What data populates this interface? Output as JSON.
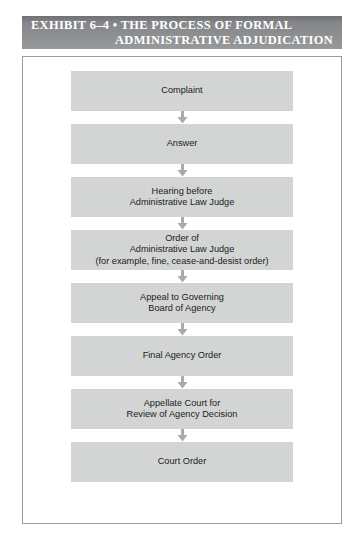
{
  "exhibit": {
    "title_line_1": "EXHIBIT 6–4 • THE PROCESS OF FORMAL",
    "title_line_2": "ADMINISTRATIVE ADJUDICATION",
    "header_bg_color": "#8d8f91",
    "header_text_color": "#ffffff"
  },
  "flowchart": {
    "box_fill_color": "#d3d5d5",
    "box_text_color": "#1b1b1b",
    "arrow_color": "#a9abab",
    "connector_icon": "down-arrow-icon",
    "steps": [
      {
        "lines": [
          "Complaint"
        ]
      },
      {
        "lines": [
          "Answer"
        ]
      },
      {
        "lines": [
          "Hearing before",
          "Administrative Law Judge"
        ]
      },
      {
        "lines": [
          "Order of",
          "Administrative Law Judge",
          "(for example, fine, cease-and-desist order)"
        ]
      },
      {
        "lines": [
          "Appeal to Governing",
          "Board of Agency"
        ]
      },
      {
        "lines": [
          "Final Agency Order"
        ]
      },
      {
        "lines": [
          "Appellate Court for",
          "Review of Agency Decision"
        ]
      },
      {
        "lines": [
          "Court Order"
        ]
      }
    ]
  }
}
